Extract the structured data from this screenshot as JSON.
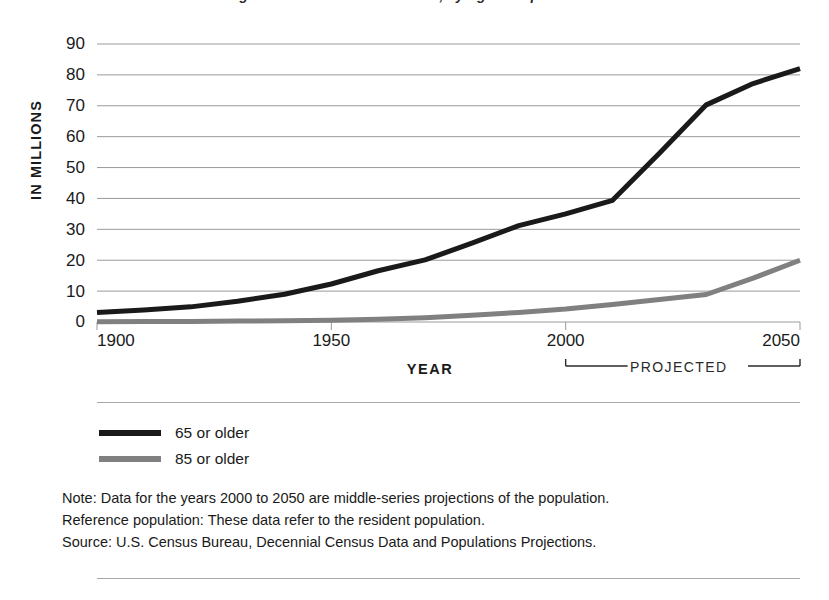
{
  "figure": {
    "title_clipped": "Number of Persons Age 65 or Older and 85 or Older, by Age Group: 1900 to 2050"
  },
  "axes": {
    "y_title": "IN MILLIONS",
    "x_title": "YEAR",
    "y_ticks": [
      "0",
      "10",
      "20",
      "30",
      "40",
      "50",
      "60",
      "70",
      "80",
      "90"
    ],
    "x_ticks": [
      "1900",
      "1950",
      "2000",
      "2050"
    ]
  },
  "annotation": {
    "projected_label": "PROJECTED",
    "projected_start": "2000",
    "projected_end": "2050"
  },
  "legend": {
    "items": [
      {
        "label": "65 or older",
        "color": "#1a1a1a"
      },
      {
        "label": "85 or older",
        "color": "#808080"
      }
    ]
  },
  "notes": [
    "Note: Data for the years 2000 to 2050 are middle-series projections of the population.",
    "Reference population: These data refer to the resident population.",
    "Source: U.S. Census Bureau, Decennial Census Data and Populations Projections."
  ],
  "chart_data": {
    "type": "line",
    "title": "Number of Persons Age 65 or Older and 85 or Older, by Age Group: 1900 to 2050",
    "xlabel": "YEAR",
    "ylabel": "IN MILLIONS",
    "xlim": [
      1900,
      2050
    ],
    "ylim": [
      0,
      90
    ],
    "yticks": [
      0,
      10,
      20,
      30,
      40,
      50,
      60,
      70,
      80,
      90
    ],
    "xticks": [
      1900,
      1950,
      2000,
      2050
    ],
    "grid": "horizontal",
    "legend_position": "below-plot-left",
    "x": [
      1900,
      1910,
      1920,
      1930,
      1940,
      1950,
      1960,
      1970,
      1980,
      1990,
      2000,
      2010,
      2020,
      2030,
      2040,
      2050
    ],
    "series": [
      {
        "name": "65 or older",
        "color": "#1a1a1a",
        "values": [
          3.1,
          3.9,
          4.9,
          6.7,
          9.0,
          12.3,
          16.6,
          20.1,
          25.5,
          31.2,
          35.0,
          39.4,
          54.6,
          70.3,
          77.2,
          82.0
        ]
      },
      {
        "name": "85 or older",
        "color": "#808080",
        "values": [
          0.1,
          0.2,
          0.2,
          0.3,
          0.4,
          0.6,
          0.9,
          1.4,
          2.2,
          3.1,
          4.2,
          5.7,
          7.3,
          8.9,
          14.2,
          20.0
        ]
      }
    ],
    "annotations": [
      {
        "text": "PROJECTED",
        "x_start": 2000,
        "x_end": 2050,
        "position": "below-axis"
      }
    ]
  }
}
